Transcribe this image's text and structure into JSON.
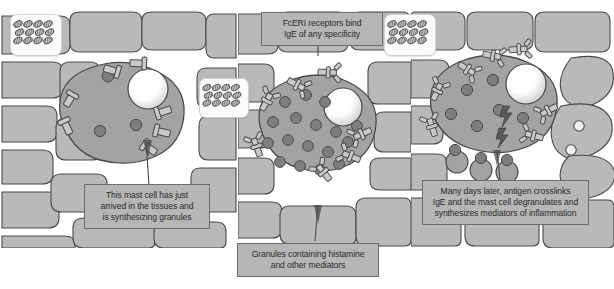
{
  "figure": {
    "kind": "biology-diagram",
    "panel_count": 3
  },
  "palette": {
    "tissue_cell": "#b9b9b9",
    "tissue_gap": "#ffffff",
    "mast_cell_body": "#a3a3a3",
    "granule": "#7e7e7e",
    "nucleus": "#ffffff",
    "receptor": "#c9c9c9",
    "outline": "#4a4a4a",
    "caption_bg": "#b6b6b6",
    "caption_border": "#6e6e6e",
    "caption_text": "#2b2b2b",
    "legend_box_bg": "#fbfbfb"
  },
  "captions": {
    "left": {
      "lines": [
        "This mast cell has just",
        "arrived in the tissues and",
        "is synthesizing granules"
      ]
    },
    "top_center": {
      "lines": [
        "FcERI receptors bind",
        "IgE of any specificity"
      ]
    },
    "bottom_center": {
      "lines": [
        "Granules containing histamine",
        "and other mediators"
      ]
    },
    "right": {
      "lines": [
        "Many days later, antigen crosslinks",
        "IgE and the mast cell degranulates and",
        "synthesizes mediators of inflammation"
      ]
    }
  },
  "legend_icons": [
    {
      "name": "granule-stack-icon-left",
      "depicts": "stack of secretory granules",
      "rows": 3,
      "cols": 4
    },
    {
      "name": "granule-stack-icon-middle",
      "depicts": "stack of secretory granules",
      "rows": 3,
      "cols": 4
    },
    {
      "name": "granule-stack-icon-right",
      "depicts": "stack of secretory granules",
      "rows": 3,
      "cols": 4
    }
  ],
  "panels": [
    {
      "id": "panel-1",
      "stage": "immature mast cell in tissue",
      "granules_in_cell": 3,
      "nucleus": true,
      "receptors_bare": 7,
      "ige_bound": 0,
      "antigen_present": false,
      "degranulating": false,
      "activation_bolts": 0
    },
    {
      "id": "panel-2",
      "stage": "mast cell coated with IgE",
      "granules_in_cell": 17,
      "nucleus": true,
      "receptors_bare": 0,
      "ige_bound": 7,
      "antigen_present": false,
      "degranulating": false,
      "activation_bolts": 0
    },
    {
      "id": "panel-3",
      "stage": "activated mast cell degranulating",
      "granules_in_cell": 9,
      "nucleus": true,
      "receptors_bare": 0,
      "ige_bound": 9,
      "antigen_present": true,
      "antigen_count": 2,
      "degranulating": true,
      "released_granules": 4,
      "activation_bolts": 2
    }
  ]
}
